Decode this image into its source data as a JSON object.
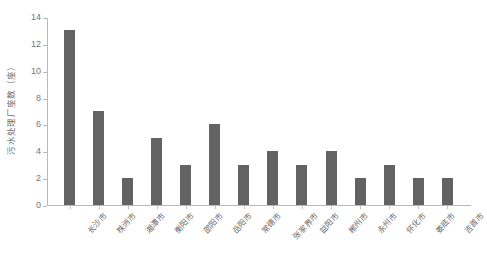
{
  "chart_data": {
    "type": "bar",
    "title": "",
    "xlabel": "",
    "ylabel": "污水处理厂座数（座）",
    "ylim": [
      0,
      14
    ],
    "yticks": [
      0,
      2,
      4,
      6,
      8,
      10,
      12,
      14
    ],
    "grid": false,
    "legend": "none",
    "bar_color": "#636363",
    "axis_color": "#b9b9b9",
    "tick_label_color": "#767676",
    "categories": [
      "长沙市",
      "株洲市",
      "湘潭市",
      "衡阳市",
      "邵阳市",
      "岳阳市",
      "常德市",
      "张家界市",
      "益阳市",
      "郴州市",
      "永州市",
      "怀化市",
      "娄底市",
      "吉首市"
    ],
    "values": [
      13,
      7,
      2,
      5,
      3,
      6,
      3,
      4,
      3,
      4,
      2,
      3,
      2,
      2
    ]
  }
}
